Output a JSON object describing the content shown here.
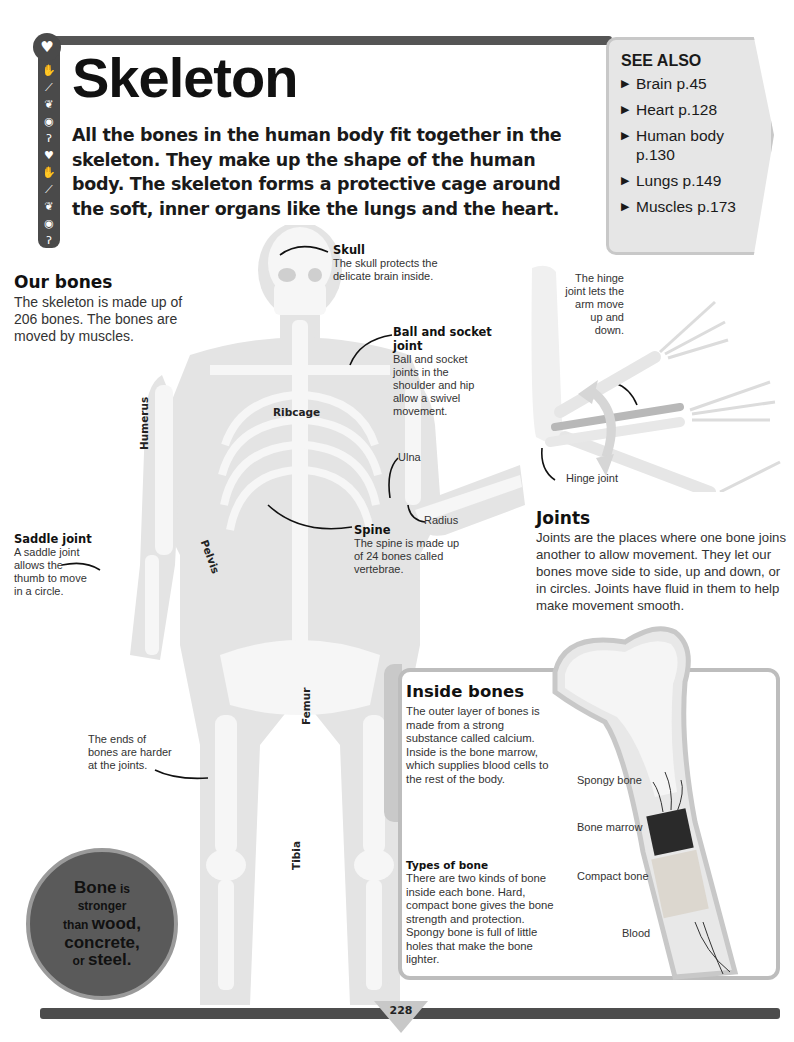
{
  "page": {
    "title": "Skeleton",
    "intro": "All the bones in the human body fit together in the skeleton. They make up the shape of the human body. The skeleton forms a protective cage around the soft, inner organs like the lungs and the heart.",
    "page_number": "228"
  },
  "icon_strip": {
    "top_icon": "heart-icon",
    "icons": [
      "hand-icon",
      "bone-icon",
      "brain-icon",
      "eye-icon",
      "ear-icon",
      "heart-icon",
      "hand-icon",
      "bone-icon",
      "brain-icon",
      "eye-icon",
      "ear-icon",
      "heart-icon"
    ]
  },
  "see_also": {
    "title": "SEE ALSO",
    "items": [
      {
        "label": "Brain p.45"
      },
      {
        "label": "Heart p.128"
      },
      {
        "label": "Human body p.130"
      },
      {
        "label": "Lungs p.149"
      },
      {
        "label": "Muscles p.173"
      }
    ]
  },
  "our_bones": {
    "heading": "Our bones",
    "body": "The skeleton is made up of 206 bones. The bones are moved by muscles."
  },
  "skeleton_labels": {
    "skull": {
      "heading": "Skull",
      "body": "The skull protects the delicate brain inside."
    },
    "ball_socket": {
      "heading": "Ball and socket joint",
      "body": "Ball and socket joints in the shoulder and hip allow a swivel movement."
    },
    "spine": {
      "heading": "Spine",
      "body": "The spine is made up of 24 bones called vertebrae."
    },
    "saddle": {
      "heading": "Saddle joint",
      "body": "A saddle joint allows the thumb to move in a circle."
    },
    "ends": "The ends of bones are harder at the joints.",
    "ulna": "Ulna",
    "radius": "Radius",
    "ribcage": "Ribcage",
    "humerus": "Humerus",
    "pelvis": "Pelvis",
    "femur": "Femur",
    "tibia": "Tibia"
  },
  "joints": {
    "hinge_caption": "The hinge joint lets the arm move up and down.",
    "hinge_label": "Hinge joint",
    "heading": "Joints",
    "body": "Joints are the places where one bone joins another to allow movement. They let our bones move side to side, up and down, or in circles. Joints have fluid in them to help make movement smooth."
  },
  "inside_bones": {
    "heading": "Inside bones",
    "body": "The outer layer of bones is made from a strong substance called calcium. Inside is the bone marrow, which supplies blood cells to the rest of the body.",
    "types_heading": "Types of bone",
    "types_body": "There are two kinds of bone inside each bone. Hard, compact bone gives the bone strength and protection. Spongy bone is full of little holes that make the bone lighter.",
    "labels": {
      "spongy": "Spongy bone",
      "marrow": "Bone marrow",
      "compact": "Compact bone",
      "blood": "Blood"
    }
  },
  "fact": {
    "w1": "Bone",
    "w2": " is",
    "w3": "stronger",
    "w4": "than ",
    "w5": "wood,",
    "w6": "concrete,",
    "w7": "or ",
    "w8": "steel."
  },
  "colors": {
    "dark_gray": "#4a4a4a",
    "panel_gray": "#e6e6e6",
    "bone": "#f2f2f2",
    "body": "#e3e3e3"
  }
}
